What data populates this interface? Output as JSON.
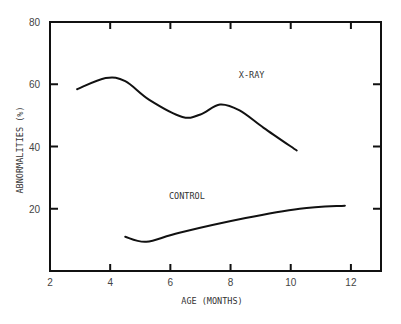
{
  "chart_data": {
    "type": "line",
    "title": "",
    "xlabel": "AGE (MONTHS)",
    "ylabel": "ABNORMALITIES (%)",
    "xlim": [
      2,
      13
    ],
    "ylim": [
      0,
      80
    ],
    "x_ticks": [
      2,
      4,
      6,
      8,
      10,
      12
    ],
    "y_ticks": [
      20,
      40,
      60,
      80
    ],
    "grid": false,
    "legend": "inline labels",
    "series": [
      {
        "name": "X-RAY",
        "label_pos": [
          8.7,
          62
        ],
        "points": [
          [
            2.9,
            58.4
          ],
          [
            3.85,
            62.0
          ],
          [
            4.5,
            61.0
          ],
          [
            5.3,
            55.0
          ],
          [
            6.4,
            49.5
          ],
          [
            7.0,
            50.3
          ],
          [
            7.65,
            53.5
          ],
          [
            8.3,
            51.6
          ],
          [
            9.1,
            46.0
          ],
          [
            10.2,
            38.7
          ]
        ]
      },
      {
        "name": "CONTROL",
        "label_pos": [
          6.55,
          23
        ],
        "points": [
          [
            4.5,
            11.0
          ],
          [
            5.2,
            9.4
          ],
          [
            6.3,
            12.3
          ],
          [
            8.5,
            17.0
          ],
          [
            10.3,
            20.0
          ],
          [
            11.8,
            21.0
          ]
        ]
      }
    ]
  }
}
